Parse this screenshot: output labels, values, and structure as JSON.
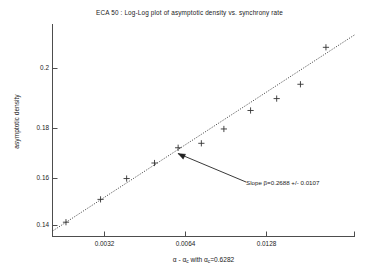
{
  "chart_data": {
    "type": "scatter",
    "title": "ECA 50 : Log-Log plot of asymptotic density vs. synchrony rate",
    "xlabel": "α - αc with αc=0.6282",
    "xlabel_parts": {
      "prefix": "α - α",
      "sub1": "c",
      "middle": " with α",
      "sub2": "c",
      "suffix": "=0.6282"
    },
    "ylabel": "asymptotic density",
    "xscale": "log",
    "yscale": "log",
    "xlim": [
      0.0022,
      0.0155
    ],
    "ylim": [
      0.1335,
      0.2185
    ],
    "xticks": [
      0.0032,
      0.0064,
      0.0128
    ],
    "xticklabels": [
      "0.0032",
      "0.0064",
      "0.0128"
    ],
    "yticks": [
      0.14,
      0.16,
      0.18,
      0.2
    ],
    "yticklabels": [
      "0.14",
      "0.16",
      "0.18",
      "0.2"
    ],
    "grid": false,
    "marker": "+",
    "marker_color": "#333333",
    "line_color": "#333333",
    "line_style": "dotted",
    "series": [
      {
        "name": "asymptotic density data",
        "x": [
          0.0024,
          0.003,
          0.00355,
          0.00425,
          0.00495,
          0.00575,
          0.00665,
          0.0079,
          0.00935,
          0.0109,
          0.01285
        ],
        "y": [
          0.138,
          0.1455,
          0.1527,
          0.1583,
          0.164,
          0.1657,
          0.1713,
          0.1788,
          0.1838,
          0.19,
          0.207
        ]
      }
    ],
    "fit_line": {
      "name": "least-squares fit",
      "slope": 0.2688,
      "slope_error": 0.0107,
      "x": [
        0.0022,
        0.0155
      ],
      "y": [
        0.1352,
        0.2132
      ]
    },
    "annotations": [
      {
        "name": "slope-annotation",
        "text": "Slope β=0.2688 +/- 0.0107",
        "arrow_from_x": 0.01005,
        "arrow_from_y": 0.1598,
        "arrow_to_x": 0.00555,
        "arrow_to_y": 0.1652
      }
    ]
  },
  "axes": {
    "yticks": [
      {
        "label": "0.2",
        "top": 64
      },
      {
        "label": "0.18",
        "top": 124
      },
      {
        "label": "0.16",
        "top": 174
      },
      {
        "label": "0.14",
        "top": 221
      }
    ],
    "xticks": [
      {
        "label": "0.0032",
        "left": 104
      },
      {
        "label": "0.0064",
        "left": 185
      },
      {
        "label": "0.0128",
        "left": 266
      }
    ]
  },
  "annotation": {
    "slope_text": "Slope β=0.2688 +/- 0.0107"
  }
}
